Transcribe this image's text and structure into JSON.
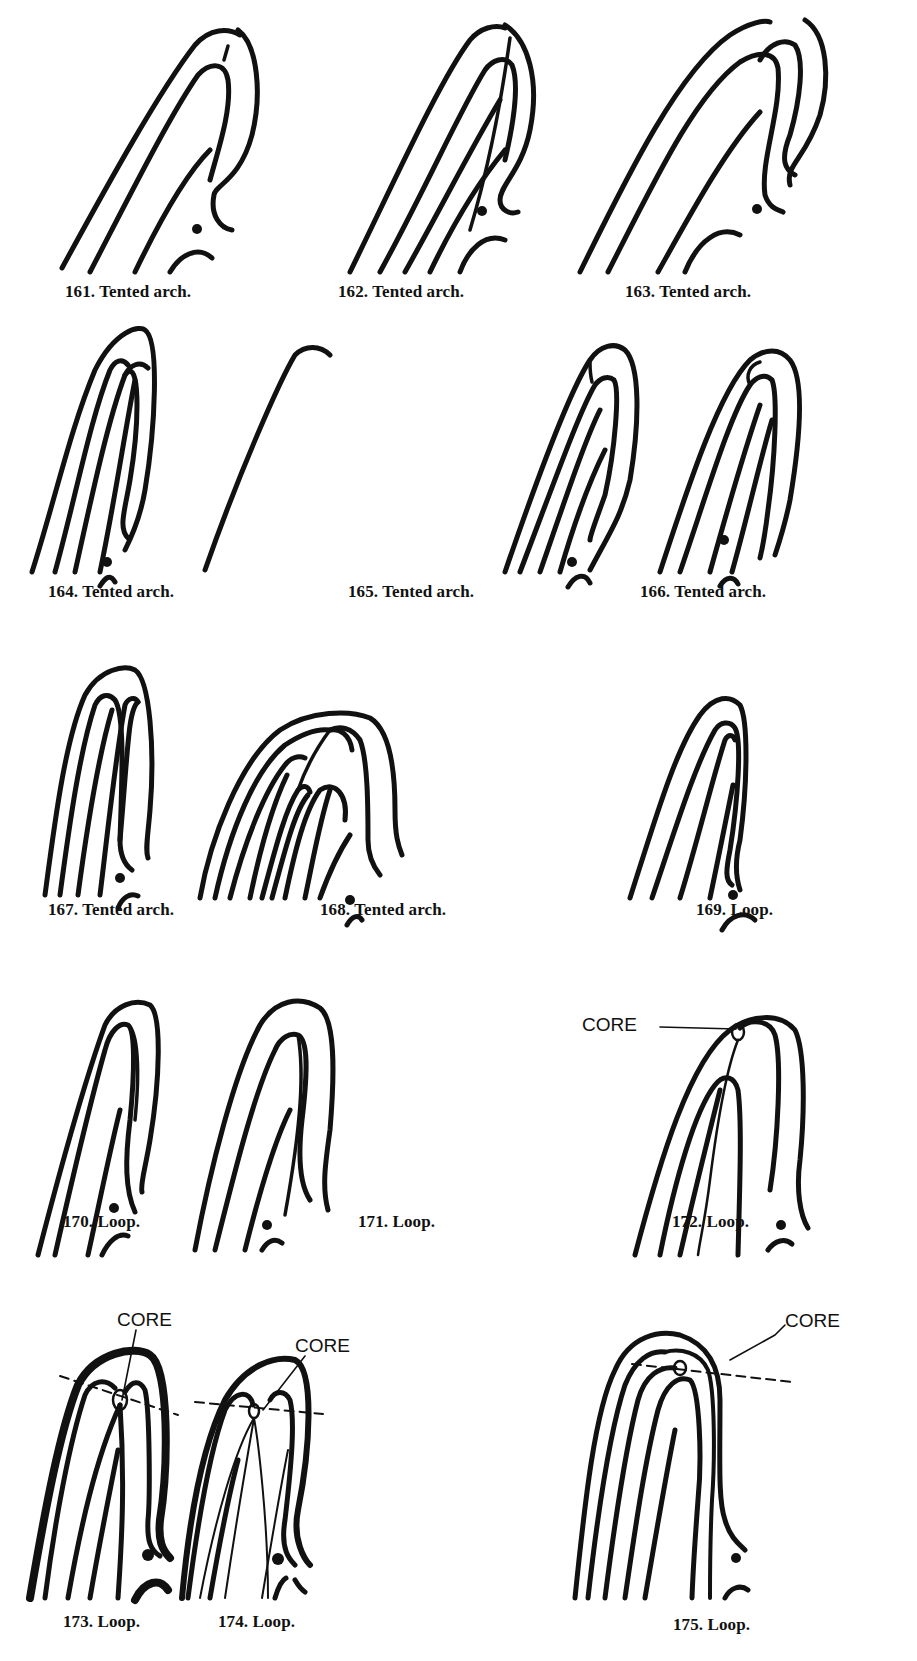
{
  "page": {
    "figures": [
      {
        "number": "161",
        "caption": "161. Tented arch.",
        "type": "Tented arch"
      },
      {
        "number": "162",
        "caption": "162. Tented arch.",
        "type": "Tented arch"
      },
      {
        "number": "163",
        "caption": "163. Tented arch.",
        "type": "Tented arch"
      },
      {
        "number": "164",
        "caption": "164. Tented arch.",
        "type": "Tented arch"
      },
      {
        "number": "165",
        "caption": "165. Tented arch.",
        "type": "Tented arch"
      },
      {
        "number": "166",
        "caption": "166. Tented arch.",
        "type": "Tented arch"
      },
      {
        "number": "167",
        "caption": "167. Tented arch.",
        "type": "Tented arch"
      },
      {
        "number": "168",
        "caption": "168. Tented arch.",
        "type": "Tented arch"
      },
      {
        "number": "169",
        "caption": "169. Loop.",
        "type": "Loop"
      },
      {
        "number": "170",
        "caption": "170. Loop.",
        "type": "Loop"
      },
      {
        "number": "171",
        "caption": "171. Loop.",
        "type": "Loop"
      },
      {
        "number": "172",
        "caption": "172. Loop.",
        "type": "Loop",
        "annotation": "CORE"
      },
      {
        "number": "173",
        "caption": "173. Loop.",
        "type": "Loop",
        "annotation": "CORE"
      },
      {
        "number": "174",
        "caption": "174. Loop.",
        "type": "Loop",
        "annotation": "CORE"
      },
      {
        "number": "175",
        "caption": "175. Loop.",
        "type": "Loop",
        "annotation": "CORE"
      }
    ]
  }
}
